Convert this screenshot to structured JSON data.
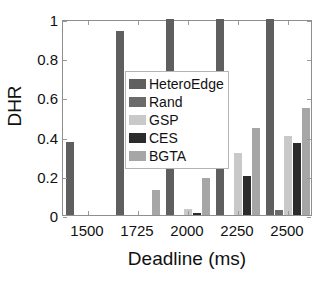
{
  "chart_data": {
    "type": "bar",
    "title": "",
    "xlabel": "Deadline (ms)",
    "ylabel": "DHR",
    "categories": [
      "1500",
      "1725",
      "2000",
      "2250",
      "2500"
    ],
    "xticks": [
      "1500",
      "1725",
      "2000",
      "2250",
      "2500"
    ],
    "yticks": [
      "0",
      "0.2",
      "0.4",
      "0.6",
      "0.8",
      "1"
    ],
    "ylim": [
      0,
      1
    ],
    "grid": false,
    "legend_position": "upper-left-inside",
    "series": [
      {
        "name": "HeteroEdge",
        "color": "#5f5f5f",
        "values": [
          0.37,
          0.94,
          1.0,
          1.0,
          1.0
        ]
      },
      {
        "name": "Rand",
        "color": "#6b6b6b",
        "values": [
          0,
          0,
          0,
          0,
          0.025
        ]
      },
      {
        "name": "GSP",
        "color": "#c9c9c9",
        "values": [
          0,
          0,
          0.03,
          0.315,
          0.405
        ]
      },
      {
        "name": "CES",
        "color": "#2b2b2b",
        "values": [
          0,
          0,
          0.01,
          0.2,
          0.365
        ]
      },
      {
        "name": "BGTA",
        "color": "#a6a6a6",
        "values": [
          0,
          0.13,
          0.19,
          0.445,
          0.545
        ]
      }
    ]
  },
  "legend": {
    "items": [
      {
        "label": "HeteroEdge",
        "color": "#5f5f5f"
      },
      {
        "label": "Rand",
        "color": "#6b6b6b"
      },
      {
        "label": "GSP",
        "color": "#c9c9c9"
      },
      {
        "label": "CES",
        "color": "#2b2b2b"
      },
      {
        "label": "BGTA",
        "color": "#a6a6a6"
      }
    ]
  },
  "axes": {
    "x_title": "Deadline (ms)",
    "y_title": "DHR"
  }
}
